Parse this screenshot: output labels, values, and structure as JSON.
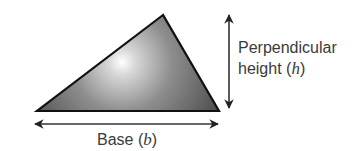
{
  "figure": {
    "shape": "triangle",
    "vertices": {
      "apex": [
        163,
        15
      ],
      "bottom_left": [
        37,
        111
      ],
      "bottom_right": [
        219,
        111
      ]
    },
    "colors": {
      "fill_dark": "#4a4a4a",
      "fill_mid": "#8a8a8a",
      "highlight": "#ffffff",
      "stroke": "#111111",
      "arrow": "#333333",
      "text": "#3a3a3a"
    }
  },
  "labels": {
    "height": {
      "line1": "Perpendicular",
      "line2_prefix": "height (",
      "line2_var": "h",
      "line2_suffix": ")"
    },
    "base": {
      "prefix": "Base (",
      "var": "b",
      "suffix": ")"
    }
  },
  "arrows": {
    "height_arrow": {
      "x": 229,
      "y1": 14,
      "y2": 108,
      "direction": "double-headed vertical"
    },
    "base_arrow": {
      "y": 124,
      "x1": 34,
      "x2": 218,
      "direction": "double-headed horizontal"
    }
  }
}
